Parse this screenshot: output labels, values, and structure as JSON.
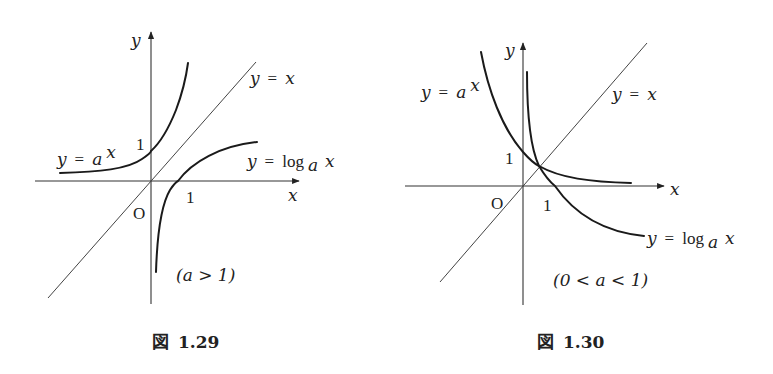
{
  "figures": [
    {
      "id": "fig-1-29",
      "caption_symbol": "図",
      "caption_number": "1.29",
      "condition": "(a > 1)",
      "axis_x_label": "x",
      "axis_y_label": "y",
      "origin_label": "O",
      "tick_y_label": "1",
      "tick_x_label": "1",
      "label_exp": {
        "lhs": "y",
        "eq": "=",
        "base": "a",
        "exp": "x"
      },
      "label_identity": {
        "lhs": "y",
        "eq": "=",
        "rhs": "x"
      },
      "label_log": {
        "lhs": "y",
        "eq": "=",
        "fn": "log",
        "sub": "a",
        "arg": "x"
      }
    },
    {
      "id": "fig-1-30",
      "caption_symbol": "図",
      "caption_number": "1.30",
      "condition": "(0 < a < 1)",
      "axis_x_label": "x",
      "axis_y_label": "y",
      "origin_label": "O",
      "tick_y_label": "1",
      "tick_x_label": "1",
      "label_exp": {
        "lhs": "y",
        "eq": "=",
        "base": "a",
        "exp": "x"
      },
      "label_identity": {
        "lhs": "y",
        "eq": "=",
        "rhs": "x"
      },
      "label_log": {
        "lhs": "y",
        "eq": "=",
        "fn": "log",
        "sub": "a",
        "arg": "x"
      }
    }
  ]
}
